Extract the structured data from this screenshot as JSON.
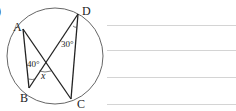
{
  "problem": {
    "number_fragment": ")",
    "points": {
      "A": {
        "label": "A",
        "x": 23,
        "y": 29
      },
      "B": {
        "label": "B",
        "x": 29,
        "y": 88
      },
      "C": {
        "label": "C",
        "x": 71,
        "y": 99
      },
      "D": {
        "label": "D",
        "x": 78,
        "y": 14
      }
    },
    "circle": {
      "cx": 55,
      "cy": 56,
      "r": 48
    },
    "angles": {
      "angle_ABD": "40°",
      "angle_ADC": "30°",
      "unknown": "x"
    },
    "answer_lines": [
      25,
      50,
      77,
      104
    ]
  },
  "colors": {
    "line": "#222222",
    "circle": "#555555",
    "answer_line": "#d4d4d4"
  }
}
